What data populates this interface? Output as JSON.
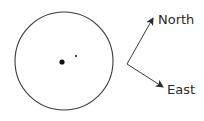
{
  "diagram": {
    "directions": {
      "north_label": "North",
      "east_label": "East"
    },
    "colors": {
      "stroke": "#3a3a3a",
      "dot": "#111111",
      "text": "#2a2a2a"
    },
    "elements": {
      "circle": "circle-outline",
      "large_dot": "large-dot",
      "small_dot": "small-dot"
    }
  }
}
